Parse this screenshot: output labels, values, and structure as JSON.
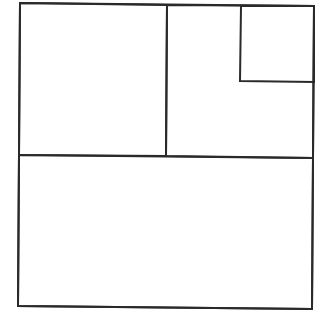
{
  "diagram": {
    "type": "rectangle-subdivision",
    "background": "#ffffff",
    "stroke_color": "#2a2a2a",
    "stroke_width": 2,
    "shapes": [
      {
        "name": "outer-square",
        "points": "20,3 314,6 312,309 18,306"
      },
      {
        "name": "top-left-square",
        "points": "20,3 167,5 166,156 19,155"
      },
      {
        "name": "top-right-rect",
        "points": "167,5 314,6 313,158 166,156"
      },
      {
        "name": "small-corner-square",
        "points": "241,6 314,6 314,82 240,81"
      },
      {
        "name": "bottom-rect",
        "points": "19,155 313,158 312,309 18,306"
      }
    ]
  }
}
